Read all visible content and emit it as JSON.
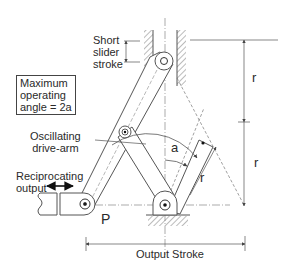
{
  "diagram": {
    "labels": {
      "short_slider_stroke": [
        "Short",
        "slider",
        "stroke"
      ],
      "max_angle": [
        "Maximum",
        "operating",
        "angle = 2a"
      ],
      "drive_arm": [
        "Oscillating",
        "drive-arm"
      ],
      "reciprocating_output": [
        "Reciprocating",
        "output"
      ],
      "pivot_p": "P",
      "angle": "a",
      "r_arm": "r",
      "r_top": "r",
      "r_bottom": "r",
      "output_stroke": "Output Stroke"
    },
    "colors": {
      "line": "#555555",
      "text": "#2a2a2a",
      "background": "#ffffff"
    }
  }
}
